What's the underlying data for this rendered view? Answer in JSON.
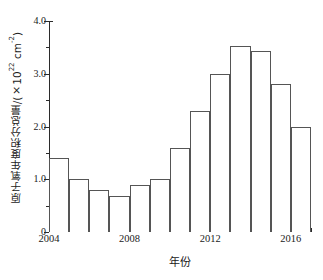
{
  "chart_data": {
    "type": "bar",
    "title": "",
    "xlabel": "年份",
    "ylabel": "原子氧年度积分总量/(×10²² cm⁻²)",
    "ylabel_parts": {
      "text": "原子氧年度积分总量/(×10",
      "exponent": "22",
      "unit": " cm",
      "unit_exponent": "-2",
      "close": ")"
    },
    "categories": [
      2004,
      2005,
      2006,
      2007,
      2008,
      2009,
      2010,
      2011,
      2012,
      2013,
      2014,
      2015,
      2016
    ],
    "values": [
      1.4,
      1.0,
      0.8,
      0.68,
      0.9,
      1.0,
      1.6,
      2.3,
      3.0,
      3.52,
      3.43,
      2.8,
      2.0
    ],
    "xlim": [
      2004,
      2017
    ],
    "ylim": [
      0,
      4.0
    ],
    "y_major_ticks": [
      {
        "value": 0,
        "label": "0"
      },
      {
        "value": 1.0,
        "label": "1.0"
      },
      {
        "value": 2.0,
        "label": "2.0"
      },
      {
        "value": 3.0,
        "label": "3.0"
      },
      {
        "value": 4.0,
        "label": "4.0"
      }
    ],
    "y_minor_ticks": [
      0.5,
      1.5,
      2.5,
      3.5
    ],
    "x_tick_labels": [
      {
        "value": 2004,
        "label": "2004"
      },
      {
        "value": 2008,
        "label": "2008"
      },
      {
        "value": 2012,
        "label": "2012"
      },
      {
        "value": 2016,
        "label": "2016"
      }
    ],
    "grid": false,
    "legend": false,
    "bar_fill": "#ffffff",
    "bar_edge": "#555555",
    "axis_color": "#2b2b2b"
  }
}
